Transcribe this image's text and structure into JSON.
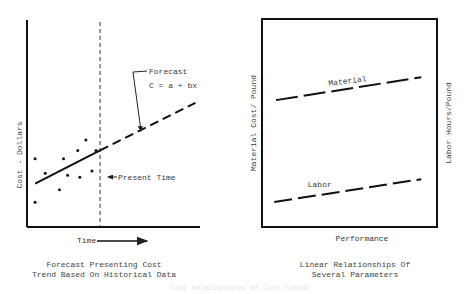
{
  "chart_data": [
    {
      "type": "scatter",
      "title": "Forecast Presenting Cost Trend Based On Historical Data",
      "xlabel": "Time",
      "ylabel": "Cost - Dollars",
      "annotations": {
        "forecast_label": "Forecast",
        "equation": "C = a + bx",
        "present_time": "Present Time"
      },
      "xlim": [
        0,
        10
      ],
      "ylim": [
        0,
        10
      ],
      "points": [
        {
          "x": 0.4,
          "y": 3.3
        },
        {
          "x": 0.9,
          "y": 2.6
        },
        {
          "x": 1.6,
          "y": 1.8
        },
        {
          "x": 0.4,
          "y": 1.2
        },
        {
          "x": 1.8,
          "y": 3.3
        },
        {
          "x": 2.0,
          "y": 2.5
        },
        {
          "x": 2.5,
          "y": 3.7
        },
        {
          "x": 2.6,
          "y": 2.4
        },
        {
          "x": 2.9,
          "y": 4.2
        },
        {
          "x": 3.2,
          "y": 2.7
        },
        {
          "x": 3.4,
          "y": 3.7
        }
      ],
      "trend_line": {
        "x": [
          0.4,
          3.6
        ],
        "y": [
          2.1,
          3.7
        ],
        "style": "solid"
      },
      "forecast_line": {
        "x": [
          3.6,
          8.3
        ],
        "y": [
          3.7,
          6.0
        ],
        "style": "dashed"
      },
      "present_time_x": 3.6
    },
    {
      "type": "line",
      "title": "Linear Relationships Of Several Parameters",
      "xlabel": "Performance",
      "ylabel_left": "Material Cost/ Pound",
      "ylabel_right": "Labor Hours/Pound",
      "xlim": [
        0,
        10
      ],
      "ylim": [
        0,
        10
      ],
      "series": [
        {
          "name": "Material",
          "x": [
            0.8,
            9.1
          ],
          "y": [
            6.1,
            7.2
          ],
          "style": "dashed"
        },
        {
          "name": "Labor",
          "x": [
            0.7,
            9.1
          ],
          "y": [
            1.2,
            2.3
          ],
          "style": "dashed"
        }
      ]
    }
  ],
  "footer": {
    "faint_caption": "Cost Relationships of Cost Trends"
  }
}
